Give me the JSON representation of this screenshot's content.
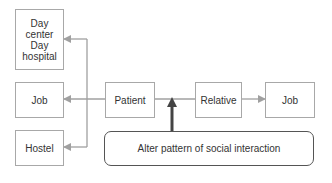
{
  "diagram": {
    "nodes": {
      "day_center": {
        "label_lines": [
          "Day",
          "center",
          "Day",
          "hospital"
        ]
      },
      "job_left": {
        "label": "Job"
      },
      "hostel": {
        "label": "Hostel"
      },
      "patient": {
        "label": "Patient"
      },
      "relative": {
        "label": "Relative"
      },
      "job_right": {
        "label": "Job"
      },
      "intervention": {
        "label": "Alter pattern of social interaction"
      }
    },
    "colors": {
      "line": "#a0a0a0",
      "thick_arrow": "#444444",
      "border": "#a8a8a8"
    }
  }
}
